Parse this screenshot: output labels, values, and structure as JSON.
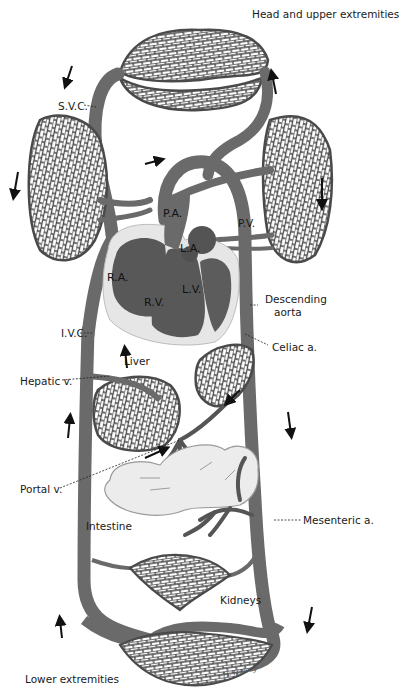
{
  "figure": {
    "colors": {
      "vessel": "#6a6a6a",
      "heart_chamber": "#585858",
      "heart_wall": "#e6e6e6",
      "intestine": "#ececec",
      "capillary_stroke": "#4a4a4a",
      "text": "#1a1a1a",
      "background": "#ffffff"
    }
  },
  "labels": {
    "head": "Head and upper extremities",
    "svc": "S.V.C.",
    "pa": "P.A.",
    "pv": "P.V.",
    "la": "L.A.",
    "ra": "R.A.",
    "rv": "R.V.",
    "lv": "L.V.",
    "descending_aorta_1": "Descending",
    "descending_aorta_2": "aorta",
    "ivc": "I.V.C.",
    "celiac": "Celiac a.",
    "liver": "Liver",
    "hepatic": "Hepatic v.",
    "portal": "Portal v.",
    "intestine": "Intestine",
    "mesenteric": "Mesenteric a.",
    "kidneys": "Kidneys",
    "lower": "Lower extremities",
    "signature": "-H. Halsey-"
  },
  "flow_arrows": [
    {
      "location": "upper-left",
      "direction": "down"
    },
    {
      "location": "upper-right",
      "direction": "up"
    },
    {
      "location": "lung-left",
      "direction": "down"
    },
    {
      "location": "lung-right",
      "direction": "down"
    },
    {
      "location": "pulmonary-artery",
      "direction": "right"
    },
    {
      "location": "liver",
      "direction": "up"
    },
    {
      "location": "ivc-lower",
      "direction": "up"
    },
    {
      "location": "portal",
      "direction": "right"
    },
    {
      "location": "celiac",
      "direction": "down-left"
    },
    {
      "location": "aorta",
      "direction": "down"
    },
    {
      "location": "lower-left",
      "direction": "up"
    },
    {
      "location": "lower-right",
      "direction": "down"
    }
  ]
}
